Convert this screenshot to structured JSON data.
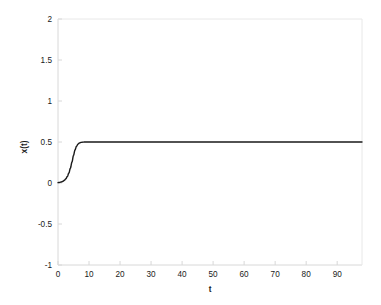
{
  "chart_data": {
    "type": "line",
    "title": "",
    "xlabel": "t",
    "ylabel": "x(t)",
    "xlim": [
      0,
      98
    ],
    "ylim": [
      -1,
      2
    ],
    "grid": false,
    "legend": null,
    "xticks": [
      0,
      10,
      20,
      30,
      40,
      50,
      60,
      70,
      80,
      90
    ],
    "xticklabels": [
      "0",
      "10",
      "20",
      "30",
      "40",
      "50",
      "60",
      "70",
      "80",
      "90"
    ],
    "yticks": [
      -1,
      -0.5,
      0,
      0.5,
      1,
      1.5,
      2
    ],
    "yticklabels": [
      "-1",
      "-0.5",
      "0",
      "0.5",
      "1",
      "1.5",
      "2"
    ],
    "line_color": "#1a1a1a",
    "line_width": 1.4,
    "axis_color": "#d8d8d8",
    "background_color": "#ffffff",
    "series": [
      {
        "name": "x(t)",
        "x": [
          0,
          0.5,
          1,
          1.5,
          2,
          2.5,
          3,
          3.5,
          4,
          4.5,
          5,
          5.5,
          6,
          6.5,
          7,
          7.5,
          8,
          8.5,
          9,
          10,
          12,
          15,
          20,
          25,
          30,
          35,
          40,
          45,
          50,
          55,
          60,
          65,
          70,
          75,
          80,
          85,
          90,
          95,
          98
        ],
        "y": [
          0.005,
          0.007,
          0.012,
          0.019,
          0.031,
          0.05,
          0.079,
          0.122,
          0.181,
          0.255,
          0.337,
          0.405,
          0.451,
          0.477,
          0.49,
          0.496,
          0.498,
          0.4994,
          0.4998,
          0.5,
          0.5,
          0.5,
          0.5,
          0.5,
          0.5,
          0.5,
          0.5,
          0.5,
          0.5,
          0.5,
          0.5,
          0.5,
          0.5,
          0.5,
          0.5,
          0.5,
          0.5,
          0.5,
          0.5
        ]
      }
    ],
    "annotations": []
  }
}
